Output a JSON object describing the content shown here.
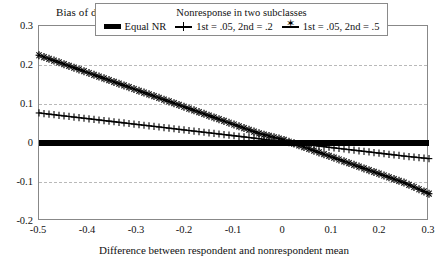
{
  "axes": {
    "y_title": "Bias of difference",
    "x_title": "Difference between respondent and nonrespondent mean",
    "y_ticks": [
      "0.3",
      "0.2",
      "0.1",
      "0",
      "-0.1",
      "-0.2"
    ],
    "x_ticks": [
      "-0.5",
      "-0.4",
      "-0.3",
      "-0.2",
      "-0.1",
      "0",
      "0.1",
      "0.2",
      "0.3"
    ]
  },
  "legend": {
    "title": "Nonresponse in two subclasses",
    "items": [
      {
        "label": "Equal NR",
        "marker": "thick-bar-icon",
        "color": "#000000"
      },
      {
        "label": "1st = .05, 2nd = .2",
        "marker": "plus-marker-icon",
        "color": "#000000"
      },
      {
        "label": "1st = .05, 2nd = .5",
        "marker": "star-marker-icon",
        "color": "#000000"
      }
    ]
  },
  "chart_data": {
    "type": "line",
    "title": "",
    "xlabel": "Difference between respondent and nonrespondent mean",
    "ylabel": "Bias of difference",
    "xlim": [
      -0.5,
      0.3
    ],
    "ylim": [
      -0.2,
      0.3
    ],
    "grid": true,
    "legend_position": "top",
    "legend_title": "Nonresponse in two subclasses",
    "x": [
      -0.5,
      -0.45,
      -0.4,
      -0.35,
      -0.3,
      -0.25,
      -0.2,
      -0.15,
      -0.1,
      -0.05,
      0,
      0.05,
      0.1,
      0.15,
      0.2,
      0.25,
      0.3
    ],
    "series": [
      {
        "name": "Equal NR",
        "marker": "thick-bar",
        "values": [
          0,
          0,
          0,
          0,
          0,
          0,
          0,
          0,
          0,
          0,
          0,
          0,
          0,
          0,
          0,
          0,
          0
        ]
      },
      {
        "name": "1st = .05, 2nd = .2",
        "marker": "plus",
        "values": [
          0.077,
          0.0697,
          0.0624,
          0.0551,
          0.0478,
          0.0405,
          0.0332,
          0.0259,
          0.0186,
          0.0113,
          0.0029,
          -0.0044,
          -0.0117,
          -0.019,
          -0.0263,
          -0.0336,
          -0.04
        ]
      },
      {
        "name": "1st = .05, 2nd = .5",
        "marker": "star",
        "values": [
          0.225,
          0.2028,
          0.1806,
          0.1584,
          0.1362,
          0.114,
          0.0918,
          0.0696,
          0.0474,
          0.0252,
          0.0089,
          -0.0133,
          -0.0355,
          -0.0577,
          -0.0799,
          -0.1021,
          -0.13
        ]
      }
    ]
  }
}
